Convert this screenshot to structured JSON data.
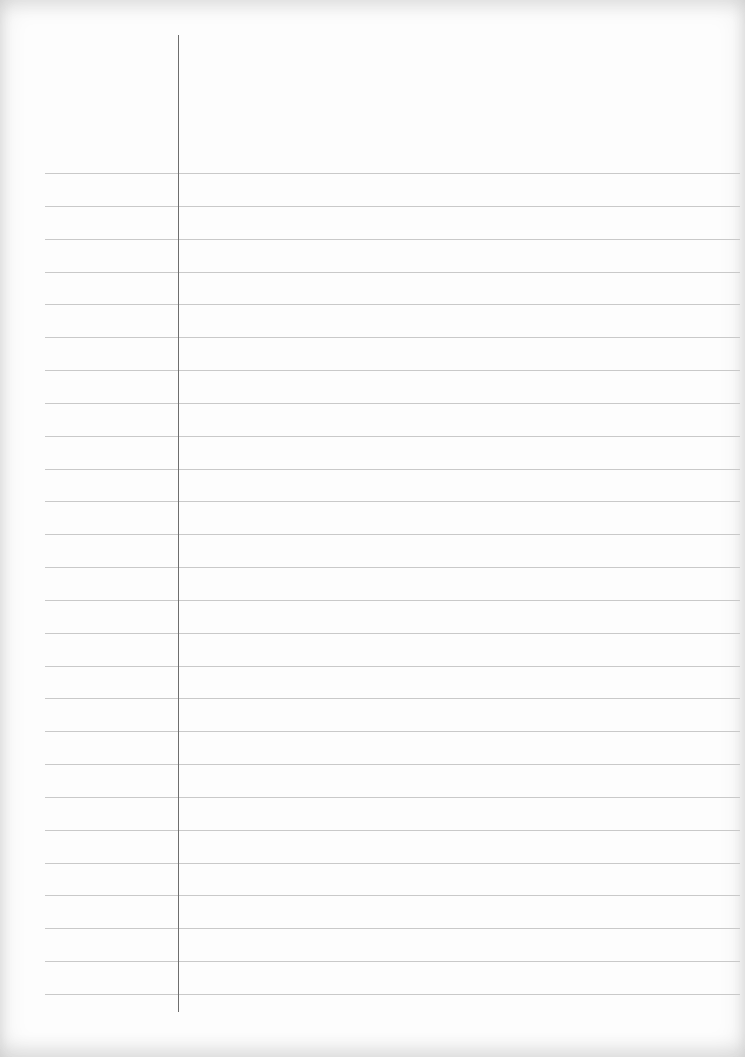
{
  "paper": {
    "type": "lined-notebook-page",
    "ruled_line_count": 26,
    "first_line_y": 173,
    "line_spacing": 32.84,
    "line_left": 45,
    "line_right": 740,
    "margin_line_x": 178,
    "margin_line_top": 35,
    "margin_line_bottom": 1012,
    "colors": {
      "background": "#fdfdfd",
      "ruled_line": "#c9c9c9",
      "margin_line": "#6e6e6e"
    }
  }
}
